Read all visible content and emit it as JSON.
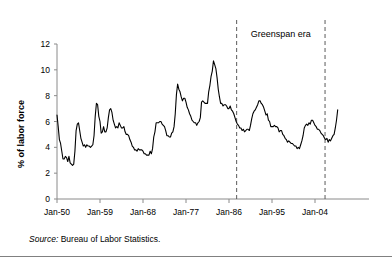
{
  "figure": {
    "source_note_prefix": "Source:",
    "source_note_text": " Bureau of Labor Statistics."
  },
  "chart_data": {
    "type": "line",
    "title": "",
    "xlabel": "",
    "ylabel": "% of labor force",
    "ylim": [
      0,
      12
    ],
    "y_ticks": [
      "0",
      "2",
      "4",
      "6",
      "8",
      "10",
      "12"
    ],
    "y_tick_values": [
      0,
      2,
      4,
      6,
      8,
      10,
      12
    ],
    "x_ticks": [
      "Jan-50",
      "Jan-59",
      "Jan-68",
      "Jan-77",
      "Jan-86",
      "Jan-95",
      "Jan-04"
    ],
    "x_tick_values": [
      1950,
      1959,
      1968,
      1977,
      1986,
      1995,
      2004
    ],
    "xlim": [
      1950,
      2009
    ],
    "grid": false,
    "legend": "none",
    "line_color": "#000000",
    "annotations": [
      {
        "label": "Greenspan era",
        "type": "span",
        "start_x": 1987.6,
        "end_x": 2006.1,
        "style": "dashed-vertical-lines"
      }
    ],
    "series": [
      {
        "name": "Unemployment rate",
        "x": [
          1950.0,
          1950.25,
          1950.5,
          1950.75,
          1951.0,
          1951.25,
          1951.5,
          1951.75,
          1952.0,
          1952.25,
          1952.5,
          1952.75,
          1953.0,
          1953.25,
          1953.5,
          1953.75,
          1954.0,
          1954.25,
          1954.5,
          1954.75,
          1955.0,
          1955.25,
          1955.5,
          1955.75,
          1956.0,
          1956.25,
          1956.5,
          1956.75,
          1957.0,
          1957.25,
          1957.5,
          1957.75,
          1958.0,
          1958.25,
          1958.5,
          1958.75,
          1959.0,
          1959.25,
          1959.5,
          1959.75,
          1960.0,
          1960.25,
          1960.5,
          1960.75,
          1961.0,
          1961.25,
          1961.5,
          1961.75,
          1962.0,
          1962.25,
          1962.5,
          1962.75,
          1963.0,
          1963.25,
          1963.5,
          1963.75,
          1964.0,
          1964.25,
          1964.5,
          1964.75,
          1965.0,
          1965.25,
          1965.5,
          1965.75,
          1966.0,
          1966.25,
          1966.5,
          1966.75,
          1967.0,
          1967.25,
          1967.5,
          1967.75,
          1968.0,
          1968.25,
          1968.5,
          1968.75,
          1969.0,
          1969.25,
          1969.5,
          1969.75,
          1970.0,
          1970.25,
          1970.5,
          1970.75,
          1971.0,
          1971.25,
          1971.5,
          1971.75,
          1972.0,
          1972.25,
          1972.5,
          1972.75,
          1973.0,
          1973.25,
          1973.5,
          1973.75,
          1974.0,
          1974.25,
          1974.5,
          1974.75,
          1975.0,
          1975.25,
          1975.5,
          1975.75,
          1976.0,
          1976.25,
          1976.5,
          1976.75,
          1977.0,
          1977.25,
          1977.5,
          1977.75,
          1978.0,
          1978.25,
          1978.5,
          1978.75,
          1979.0,
          1979.25,
          1979.5,
          1979.75,
          1980.0,
          1980.25,
          1980.5,
          1980.75,
          1981.0,
          1981.25,
          1981.5,
          1981.75,
          1982.0,
          1982.25,
          1982.5,
          1982.75,
          1983.0,
          1983.25,
          1983.5,
          1983.75,
          1984.0,
          1984.25,
          1984.5,
          1984.75,
          1985.0,
          1985.25,
          1985.5,
          1985.75,
          1986.0,
          1986.25,
          1986.5,
          1986.75,
          1987.0,
          1987.25,
          1987.5,
          1987.75,
          1988.0,
          1988.25,
          1988.5,
          1988.75,
          1989.0,
          1989.25,
          1989.5,
          1989.75,
          1990.0,
          1990.25,
          1990.5,
          1990.75,
          1991.0,
          1991.25,
          1991.5,
          1991.75,
          1992.0,
          1992.25,
          1992.5,
          1992.75,
          1993.0,
          1993.25,
          1993.5,
          1993.75,
          1994.0,
          1994.25,
          1994.5,
          1994.75,
          1995.0,
          1995.25,
          1995.5,
          1995.75,
          1996.0,
          1996.25,
          1996.5,
          1996.75,
          1997.0,
          1997.25,
          1997.5,
          1997.75,
          1998.0,
          1998.25,
          1998.5,
          1998.75,
          1999.0,
          1999.25,
          1999.5,
          1999.75,
          2000.0,
          2000.25,
          2000.5,
          2000.75,
          2001.0,
          2001.25,
          2001.5,
          2001.75,
          2002.0,
          2002.25,
          2002.5,
          2002.75,
          2003.0,
          2003.25,
          2003.5,
          2003.75,
          2004.0,
          2004.25,
          2004.5,
          2004.75,
          2005.0,
          2005.25,
          2005.5,
          2005.75,
          2006.0,
          2006.25,
          2006.5,
          2006.75,
          2007.0,
          2007.25,
          2007.5,
          2007.75,
          2008.0,
          2008.25,
          2008.5,
          2008.75
        ],
        "values": [
          6.5,
          5.6,
          4.6,
          4.3,
          3.7,
          3.1,
          3.1,
          3.3,
          3.2,
          2.9,
          3.3,
          2.8,
          2.7,
          2.6,
          2.7,
          3.7,
          5.3,
          5.8,
          5.9,
          5.3,
          4.7,
          4.4,
          4.1,
          4.2,
          4.0,
          4.2,
          4.1,
          4.1,
          4.0,
          4.1,
          4.2,
          4.9,
          6.4,
          7.4,
          7.3,
          6.4,
          6.0,
          5.1,
          5.2,
          5.6,
          5.2,
          5.2,
          5.5,
          6.3,
          6.9,
          7.0,
          6.7,
          6.1,
          5.8,
          5.5,
          5.6,
          5.5,
          5.9,
          5.7,
          5.5,
          5.5,
          5.6,
          5.2,
          5.0,
          5.0,
          4.9,
          4.6,
          4.4,
          4.1,
          4.0,
          3.8,
          3.8,
          3.7,
          3.9,
          3.8,
          3.8,
          3.8,
          3.7,
          3.5,
          3.5,
          3.4,
          3.4,
          3.4,
          3.7,
          3.5,
          3.9,
          4.8,
          5.2,
          5.9,
          5.9,
          5.9,
          6.0,
          6.0,
          5.8,
          5.7,
          5.6,
          5.3,
          4.9,
          4.9,
          4.8,
          4.8,
          5.1,
          5.2,
          5.6,
          6.6,
          8.1,
          8.9,
          8.5,
          8.3,
          7.9,
          7.6,
          7.8,
          7.8,
          7.5,
          7.1,
          6.9,
          6.6,
          6.4,
          6.1,
          6.0,
          5.9,
          5.9,
          5.7,
          5.9,
          6.0,
          6.3,
          7.5,
          7.6,
          7.5,
          7.4,
          7.4,
          7.4,
          8.3,
          8.8,
          9.5,
          9.9,
          10.7,
          10.4,
          10.1,
          9.4,
          8.5,
          7.9,
          7.4,
          7.4,
          7.2,
          7.3,
          7.3,
          7.2,
          7.0,
          7.0,
          7.2,
          6.9,
          6.8,
          6.6,
          6.3,
          6.0,
          5.8,
          5.7,
          5.5,
          5.5,
          5.3,
          5.4,
          5.2,
          5.3,
          5.4,
          5.4,
          5.3,
          5.7,
          6.2,
          6.6,
          6.8,
          6.9,
          7.1,
          7.3,
          7.6,
          7.6,
          7.4,
          7.3,
          7.1,
          6.8,
          6.5,
          6.6,
          6.1,
          6.0,
          5.6,
          5.6,
          5.6,
          5.7,
          5.6,
          5.6,
          5.5,
          5.2,
          5.3,
          5.3,
          5.0,
          4.9,
          4.7,
          4.6,
          4.4,
          4.5,
          4.4,
          4.3,
          4.3,
          4.2,
          4.1,
          4.1,
          3.9,
          4.0,
          3.9,
          4.2,
          4.5,
          4.9,
          5.5,
          5.7,
          5.8,
          5.7,
          5.9,
          5.8,
          6.1,
          6.1,
          5.9,
          5.7,
          5.6,
          5.4,
          5.4,
          5.3,
          5.1,
          5.0,
          4.9,
          4.7,
          4.6,
          4.7,
          4.4,
          4.6,
          4.5,
          4.7,
          4.9,
          5.0,
          5.5,
          6.1,
          6.9
        ]
      }
    ]
  }
}
